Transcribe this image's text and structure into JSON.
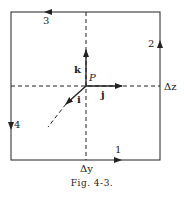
{
  "figure": {
    "caption": "Fig. 4-3.",
    "point_label": "P",
    "unit_vectors": {
      "i": "i",
      "j": "j",
      "k": "k"
    },
    "dimension_labels": {
      "horizontal": "Δy",
      "vertical": "Δz"
    },
    "path_segments": [
      {
        "label": "1",
        "side": "bottom",
        "direction": "right"
      },
      {
        "label": "2",
        "side": "right",
        "direction": "up"
      },
      {
        "label": "3",
        "side": "top",
        "direction": "left"
      },
      {
        "label": "4",
        "side": "left",
        "direction": "down"
      }
    ],
    "colors": {
      "line": "#222222",
      "background": "#ffffff"
    }
  }
}
